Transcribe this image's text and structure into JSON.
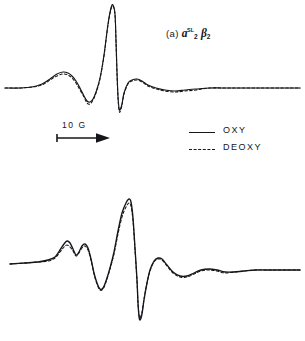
{
  "figure": {
    "background": "#ffffff",
    "ink_color": "#15161a",
    "width": 305,
    "height": 341
  },
  "scale_bar": {
    "label": "10 G",
    "arrow_direction": "right",
    "length_px": 58
  },
  "legend": {
    "position": "middle-right",
    "entries": [
      {
        "label": "OXY",
        "style": "solid",
        "key_name": "legend-key-solid"
      },
      {
        "label": "DEOXY",
        "style": "dashed",
        "key_name": "legend-key-dashed"
      }
    ]
  },
  "panels": [
    {
      "id": "a",
      "paren": "(a)",
      "symbol_1": "a",
      "symbol_1_sub": "2",
      "symbol_1_sup": "SL",
      "symbol_2": "β",
      "symbol_2_sub": "2",
      "symbol_2_sup": "",
      "label_plain": "(a) a2SL β2"
    },
    {
      "id": "b",
      "paren": "(b)",
      "symbol_1": "a",
      "symbol_1_sub": "2",
      "symbol_1_sup": "",
      "symbol_2": "β",
      "symbol_2_sub": "2",
      "symbol_2_sup": "SL",
      "label_plain": "(b) a2 β2SL"
    }
  ],
  "chart_data": {
    "type": "line",
    "title": "",
    "xlabel": "",
    "ylabel": "",
    "grid": false,
    "legend_position": "middle-right",
    "axis_note": "Magnetic field increases to the right; horizontal scale bar = 10 G",
    "panels": [
      {
        "id": "a",
        "name": "a2SL beta2",
        "baseline_y": 88,
        "series": [
          {
            "name": "OXY",
            "style": "solid",
            "points_px": [
              [
                5,
                88
              ],
              [
                20,
                88
              ],
              [
                32,
                87
              ],
              [
                42,
                84
              ],
              [
                50,
                79
              ],
              [
                57,
                74
              ],
              [
                63,
                72
              ],
              [
                68,
                73
              ],
              [
                72,
                76
              ],
              [
                76,
                81
              ],
              [
                80,
                88
              ],
              [
                84,
                96
              ],
              [
                87,
                101
              ],
              [
                90,
                102
              ],
              [
                93,
                99
              ],
              [
                96,
                92
              ],
              [
                100,
                78
              ],
              [
                104,
                55
              ],
              [
                108,
                24
              ],
              [
                111,
                8
              ],
              [
                113,
                5
              ],
              [
                115,
                14
              ],
              [
                116,
                40
              ],
              [
                117,
                72
              ],
              [
                118,
                96
              ],
              [
                119,
                108
              ],
              [
                120,
                110
              ],
              [
                122,
                104
              ],
              [
                124,
                93
              ],
              [
                128,
                83
              ],
              [
                132,
                80
              ],
              [
                137,
                79
              ],
              [
                142,
                81
              ],
              [
                148,
                85
              ],
              [
                156,
                88
              ],
              [
                165,
                90
              ],
              [
                175,
                91
              ],
              [
                185,
                90
              ],
              [
                196,
                89
              ],
              [
                210,
                88
              ],
              [
                230,
                88
              ],
              [
                260,
                88
              ],
              [
                290,
                88
              ],
              [
                300,
                88
              ]
            ]
          },
          {
            "name": "DEOXY",
            "style": "dashed",
            "points_px": [
              [
                5,
                88
              ],
              [
                20,
                88
              ],
              [
                32,
                87
              ],
              [
                42,
                85
              ],
              [
                50,
                80
              ],
              [
                57,
                76
              ],
              [
                63,
                74
              ],
              [
                68,
                75
              ],
              [
                72,
                78
              ],
              [
                76,
                83
              ],
              [
                80,
                90
              ],
              [
                84,
                97
              ],
              [
                87,
                103
              ],
              [
                90,
                104
              ],
              [
                93,
                100
              ],
              [
                96,
                93
              ],
              [
                100,
                79
              ],
              [
                104,
                56
              ],
              [
                108,
                25
              ],
              [
                111,
                9
              ],
              [
                113,
                6
              ],
              [
                115,
                15
              ],
              [
                116,
                42
              ],
              [
                117,
                74
              ],
              [
                118,
                98
              ],
              [
                119,
                110
              ],
              [
                120,
                112
              ],
              [
                122,
                105
              ],
              [
                124,
                94
              ],
              [
                128,
                84
              ],
              [
                132,
                81
              ],
              [
                137,
                80
              ],
              [
                142,
                82
              ],
              [
                148,
                86
              ],
              [
                156,
                89
              ],
              [
                165,
                91
              ],
              [
                175,
                92
              ],
              [
                185,
                91
              ],
              [
                196,
                90
              ],
              [
                210,
                88
              ],
              [
                230,
                88
              ],
              [
                260,
                88
              ],
              [
                290,
                88
              ],
              [
                300,
                88
              ]
            ]
          }
        ],
        "features": {
          "main_positive_peak_x": 113,
          "main_positive_peak_y": 5,
          "main_negative_peak_x": 120,
          "main_negative_peak_y": 110,
          "low_field_shoulder_x": 63,
          "low_field_trough_x": 90
        }
      },
      {
        "id": "b",
        "name": "a2 beta2SL",
        "baseline_y": 262,
        "series": [
          {
            "name": "OXY",
            "style": "solid",
            "points_px": [
              [
                10,
                264
              ],
              [
                25,
                263
              ],
              [
                38,
                262
              ],
              [
                48,
                260
              ],
              [
                55,
                257
              ],
              [
                60,
                250
              ],
              [
                64,
                244
              ],
              [
                67,
                241
              ],
              [
                70,
                243
              ],
              [
                73,
                249
              ],
              [
                76,
                255
              ],
              [
                79,
                252
              ],
              [
                82,
                246
              ],
              [
                85,
                244
              ],
              [
                88,
                248
              ],
              [
                91,
                259
              ],
              [
                94,
                273
              ],
              [
                97,
                283
              ],
              [
                100,
                289
              ],
              [
                103,
                288
              ],
              [
                106,
                281
              ],
              [
                110,
                268
              ],
              [
                114,
                252
              ],
              [
                118,
                231
              ],
              [
                122,
                213
              ],
              [
                126,
                203
              ],
              [
                129,
                199
              ],
              [
                131,
                202
              ],
              [
                133,
                218
              ],
              [
                135,
                248
              ],
              [
                137,
                280
              ],
              [
                138,
                303
              ],
              [
                139,
                316
              ],
              [
                140,
                320
              ],
              [
                142,
                314
              ],
              [
                144,
                300
              ],
              [
                147,
                283
              ],
              [
                150,
                270
              ],
              [
                154,
                261
              ],
              [
                158,
                258
              ],
              [
                162,
                259
              ],
              [
                167,
                265
              ],
              [
                173,
                272
              ],
              [
                180,
                276
              ],
              [
                187,
                276
              ],
              [
                194,
                273
              ],
              [
                201,
                270
              ],
              [
                209,
                269
              ],
              [
                217,
                270
              ],
              [
                225,
                272
              ],
              [
                234,
                272
              ],
              [
                244,
                271
              ],
              [
                256,
                270
              ],
              [
                270,
                270
              ],
              [
                285,
                270
              ],
              [
                300,
                270
              ]
            ]
          },
          {
            "name": "DEOXY",
            "style": "dashed",
            "points_px": [
              [
                10,
                264
              ],
              [
                25,
                263
              ],
              [
                38,
                262
              ],
              [
                48,
                261
              ],
              [
                55,
                258
              ],
              [
                60,
                252
              ],
              [
                64,
                247
              ],
              [
                67,
                245
              ],
              [
                70,
                247
              ],
              [
                73,
                251
              ],
              [
                76,
                256
              ],
              [
                79,
                253
              ],
              [
                82,
                248
              ],
              [
                85,
                246
              ],
              [
                88,
                250
              ],
              [
                91,
                260
              ],
              [
                94,
                274
              ],
              [
                97,
                284
              ],
              [
                100,
                290
              ],
              [
                103,
                289
              ],
              [
                106,
                282
              ],
              [
                110,
                269
              ],
              [
                114,
                254
              ],
              [
                118,
                234
              ],
              [
                122,
                217
              ],
              [
                126,
                207
              ],
              [
                129,
                203
              ],
              [
                131,
                206
              ],
              [
                133,
                221
              ],
              [
                135,
                250
              ],
              [
                137,
                281
              ],
              [
                138,
                303
              ],
              [
                139,
                315
              ],
              [
                140,
                318
              ],
              [
                142,
                312
              ],
              [
                144,
                299
              ],
              [
                147,
                283
              ],
              [
                150,
                271
              ],
              [
                154,
                262
              ],
              [
                158,
                259
              ],
              [
                162,
                260
              ],
              [
                167,
                266
              ],
              [
                173,
                273
              ],
              [
                180,
                277
              ],
              [
                187,
                277
              ],
              [
                194,
                274
              ],
              [
                201,
                271
              ],
              [
                209,
                270
              ],
              [
                217,
                271
              ],
              [
                225,
                273
              ],
              [
                234,
                272
              ],
              [
                244,
                271
              ],
              [
                256,
                270
              ],
              [
                270,
                270
              ],
              [
                285,
                270
              ],
              [
                300,
                270
              ]
            ]
          }
        ],
        "features": {
          "main_positive_peak_x": 129,
          "main_positive_peak_y": 199,
          "main_negative_peak_x": 140,
          "main_negative_peak_y": 320,
          "low_field_hump_1_x": 67,
          "low_field_hump_2_x": 84,
          "low_field_trough_x": 100
        }
      }
    ]
  }
}
